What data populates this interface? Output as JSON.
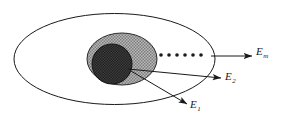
{
  "figure": {
    "name": "nested-energy-set-diagram",
    "background_color": "#ffffff",
    "stroke_color": "#1a1a1a"
  },
  "shapes": {
    "outer_ellipse": {
      "name": "outer-ellipse",
      "cx": 114.5,
      "cy": 59,
      "rx": 100.5,
      "ry": 45.5,
      "fill": "#ffffff",
      "stroke": "#1a1a1a",
      "stroke_width": 1
    },
    "middle_ellipse": {
      "name": "middle-shaded-ellipse",
      "cx": 122,
      "cy": 59,
      "rx": 35,
      "ry": 26,
      "fill": "#9a9a9a",
      "stroke": "#2b2b2b",
      "stroke_width": 1
    },
    "inner_circle": {
      "name": "inner-dotted-circle",
      "cx": 112,
      "cy": 64,
      "r": 20,
      "fill": "#3a3a3a",
      "stroke": "#1a1a1a",
      "stroke_width": 1
    }
  },
  "dots": {
    "name": "ellipsis-dots",
    "count": 6,
    "y": 55,
    "start_x": 161,
    "spacing": 8,
    "radius": 1.8,
    "color": "#1a1a1a"
  },
  "arrows": [
    {
      "name": "arrow-to-em",
      "label": "E",
      "subscript": "m",
      "x1": 211,
      "y1": 56,
      "x2": 252,
      "y2": 56
    },
    {
      "name": "arrow-to-e2",
      "label": "E",
      "subscript": "2",
      "x1": 128,
      "y1": 69,
      "x2": 221,
      "y2": 78
    },
    {
      "name": "arrow-to-e1",
      "label": "E",
      "subscript": "1",
      "x1": 131,
      "y1": 71,
      "x2": 187,
      "y2": 104
    }
  ],
  "labels": {
    "em": {
      "name": "label-em",
      "base": "E",
      "sub": "m"
    },
    "e2": {
      "name": "label-e2",
      "base": "E",
      "sub": "2"
    },
    "e1": {
      "name": "label-e1",
      "base": "E",
      "sub": "1"
    }
  }
}
